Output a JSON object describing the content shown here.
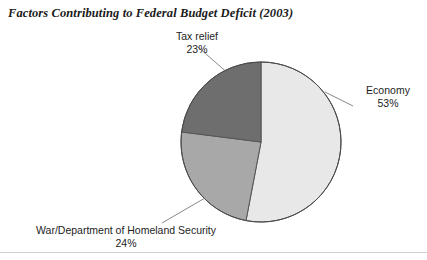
{
  "chart_title": "Factors Contributing to Federal Budget Deficit (2003)",
  "footer": {
    "artifact_text": " "
  },
  "chart_data": {
    "type": "pie",
    "title": "Factors Contributing to Federal Budget Deficit (2003)",
    "xlabel": "",
    "ylabel": "",
    "legend_position": "none",
    "grid": false,
    "start_angle_deg": 0,
    "direction": "clockwise",
    "categories": [
      "Economy",
      "War/Department of Homeland Security",
      "Tax relief"
    ],
    "values": [
      53,
      24,
      23
    ],
    "value_unit": "%",
    "total": 100,
    "slices": [
      {
        "name": "Economy",
        "label": "Economy",
        "value": 53,
        "value_label": "53%",
        "color": "#e8e8e8",
        "start_angle_deg": 0,
        "end_angle_deg": 190.8,
        "label_position": "right"
      },
      {
        "name": "War/Department of Homeland Security",
        "label": "War/Department of Homeland Security",
        "value": 24,
        "value_label": "24%",
        "color": "#a8a8a8",
        "start_angle_deg": 190.8,
        "end_angle_deg": 277.2,
        "label_position": "bottom-left"
      },
      {
        "name": "Tax relief",
        "label": "Tax relief",
        "value": 23,
        "value_label": "23%",
        "color": "#6e6e6e",
        "start_angle_deg": 277.2,
        "end_angle_deg": 360,
        "label_position": "top"
      }
    ],
    "geometry": {
      "center_x": 261,
      "center_y": 142,
      "radius": 80,
      "outline_color": "#555555"
    }
  }
}
